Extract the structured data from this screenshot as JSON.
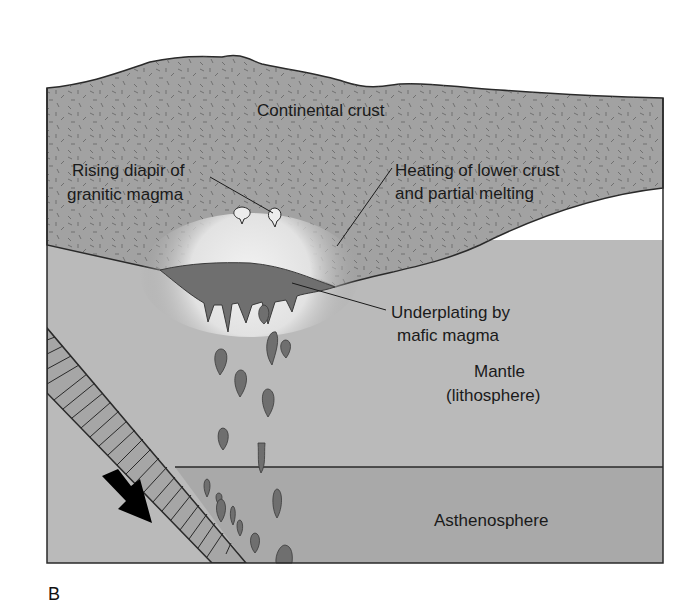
{
  "figure": {
    "panel_label": "B",
    "labels": {
      "continental_crust": "Continental crust",
      "diapir_line1": "Rising diapir of",
      "diapir_line2": "granitic magma",
      "heating_line1": "Heating of lower crust",
      "heating_line2": "and partial melting",
      "underplating_line1": "Underplating by",
      "underplating_line2": "mafic magma",
      "mantle_line1": "Mantle",
      "mantle_line2": "(lithosphere)",
      "asthenosphere": "Asthenosphere"
    },
    "colors": {
      "crust": "#a2a2a2",
      "mantle": "#bababa",
      "asthenosphere": "#a9a9a9",
      "mafic_magma": "#6f6f6f",
      "slab": "#a6a6a6",
      "outline": "#2a2a2a",
      "arrow": "#000000"
    }
  }
}
